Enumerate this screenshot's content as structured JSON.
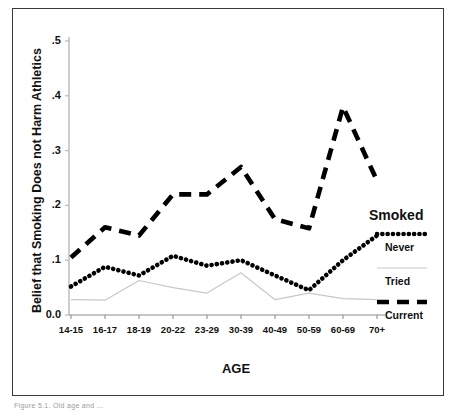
{
  "figure": {
    "caption": "Figure 5.1.  Old age and ..."
  },
  "chart_data": {
    "type": "line",
    "title": "",
    "xlabel": "AGE",
    "ylabel": "Belief that Smoking Does not Harm Athletics",
    "categories": [
      "14-15",
      "16-17",
      "18-19",
      "20-22",
      "23-29",
      "30-39",
      "40-49",
      "50-59",
      "60-69",
      "70+"
    ],
    "ylim": [
      0.0,
      0.5
    ],
    "ytick_labels": [
      "0.0",
      ".1",
      ".2",
      ".3",
      ".4",
      ".5"
    ],
    "ytick_values": [
      0.0,
      0.1,
      0.2,
      0.3,
      0.4,
      0.5
    ],
    "grid": false,
    "legend_position": "right",
    "legend_title": "Smoked",
    "series": [
      {
        "name": "Never",
        "style": "dotted",
        "color": "#000000",
        "values": [
          0.052,
          0.088,
          0.072,
          0.108,
          0.09,
          0.1,
          0.072,
          0.045,
          0.1,
          0.145
        ]
      },
      {
        "name": "Tried",
        "style": "solid-thin",
        "color": "#c8c8c8",
        "values": [
          0.028,
          0.027,
          0.063,
          0.05,
          0.04,
          0.077,
          0.028,
          0.04,
          0.03,
          0.028
        ]
      },
      {
        "name": "Current",
        "style": "dashed",
        "color": "#000000",
        "values": [
          0.105,
          0.16,
          0.145,
          0.22,
          0.22,
          0.27,
          0.175,
          0.158,
          0.38,
          0.245
        ]
      }
    ]
  }
}
